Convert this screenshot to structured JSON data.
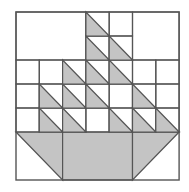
{
  "diagram": {
    "colors": {
      "fill": "#c4c4c4",
      "line": "#555555",
      "background": "#ffffff"
    },
    "grid": {
      "cols": 7,
      "rows": 7,
      "x0": 16,
      "y0": 12,
      "cell_w": 23.3,
      "cell_h": 24
    },
    "large_blocks": [
      {
        "name": "top-left-sky",
        "col": 0,
        "row": 0,
        "w": 3,
        "h": 2
      },
      {
        "name": "top-right-sky",
        "col": 5,
        "row": 0,
        "w": 2,
        "h": 2
      }
    ],
    "triangles": [
      {
        "col": 3,
        "row": 0
      },
      {
        "col": 3,
        "row": 1
      },
      {
        "col": 4,
        "row": 1
      },
      {
        "col": 2,
        "row": 2
      },
      {
        "col": 3,
        "row": 2
      },
      {
        "col": 4,
        "row": 2
      },
      {
        "col": 1,
        "row": 3
      },
      {
        "col": 2,
        "row": 3
      },
      {
        "col": 3,
        "row": 3
      },
      {
        "col": 5,
        "row": 3
      },
      {
        "col": 1,
        "row": 4
      },
      {
        "col": 2,
        "row": 4
      },
      {
        "col": 4,
        "row": 4
      },
      {
        "col": 5,
        "row": 4
      },
      {
        "col": 6,
        "row": 4
      }
    ],
    "boat": {
      "row": 5,
      "h": 2
    }
  }
}
